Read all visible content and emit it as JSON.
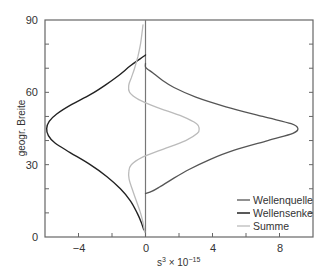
{
  "chart_data": {
    "type": "line",
    "title": "",
    "xlabel": "s³ × 10⁻¹⁵",
    "ylabel": "geogr. Breite",
    "xlim": [
      -6,
      10
    ],
    "ylim": [
      0,
      90
    ],
    "xticks": [
      -4,
      0,
      4,
      8
    ],
    "xticks_minor": [
      -6,
      -2,
      2,
      6,
      10
    ],
    "yticks": [
      0,
      30,
      60,
      90
    ],
    "yticks_minor": [
      10,
      20,
      40,
      50,
      70,
      80
    ],
    "grid": false,
    "zero_line": true,
    "legend_position": "lower right",
    "orientation": "x is value, y is latitude",
    "series": [
      {
        "name": "Wellenquelle",
        "color": "#555555",
        "width": 1.3,
        "lat": [
          18,
          19,
          21,
          24,
          28,
          32,
          36,
          40,
          43,
          45,
          47,
          50,
          54,
          58,
          62,
          65,
          68,
          69.5,
          70.5,
          72
        ],
        "values": [
          0,
          0.4,
          0.9,
          1.6,
          2.6,
          3.8,
          5.3,
          7.3,
          8.8,
          9.1,
          8.7,
          7.0,
          4.8,
          3.0,
          1.7,
          1.0,
          0.45,
          0.15,
          0,
          0
        ]
      },
      {
        "name": "Wellensenke",
        "color": "#222222",
        "width": 1.4,
        "lat": [
          3,
          6,
          10,
          15,
          20,
          25,
          30,
          35,
          39,
          42,
          45,
          48,
          51,
          55,
          59,
          63,
          67,
          71,
          74,
          75.5
        ],
        "values": [
          -0.1,
          -0.25,
          -0.5,
          -0.9,
          -1.5,
          -2.3,
          -3.3,
          -4.5,
          -5.4,
          -5.8,
          -5.9,
          -5.75,
          -5.3,
          -4.4,
          -3.3,
          -2.4,
          -1.6,
          -0.9,
          -0.3,
          0
        ]
      },
      {
        "name": "Summe",
        "color": "#bbbbbb",
        "width": 1.3,
        "lat": [
          2,
          6,
          10,
          15,
          20,
          24,
          27,
          30,
          33,
          36,
          40,
          43,
          45,
          47,
          50,
          54,
          57,
          60,
          63,
          66,
          70,
          75,
          80,
          85,
          88
        ],
        "values": [
          -0.05,
          -0.15,
          -0.3,
          -0.55,
          -0.8,
          -0.98,
          -1.0,
          -0.85,
          -0.2,
          0.9,
          2.4,
          3.1,
          3.2,
          3.05,
          2.2,
          0.6,
          -0.4,
          -0.95,
          -1.0,
          -0.85,
          -0.65,
          -0.45,
          -0.3,
          -0.2,
          -0.15
        ]
      }
    ]
  },
  "axes": {
    "y_title": "geogr. Breite",
    "x_title_base": "s",
    "x_title_sup": "3",
    "x_title_mid": " × 10",
    "x_title_exp": "−15",
    "x_tick_labels": [
      "−4",
      "0",
      "4",
      "8"
    ],
    "y_tick_labels": [
      "0",
      "30",
      "60",
      "90"
    ]
  },
  "legend": {
    "items": [
      {
        "label": "Wellenquelle",
        "color": "#555555"
      },
      {
        "label": "Wellensenke",
        "color": "#222222"
      },
      {
        "label": "Summe",
        "color": "#bbbbbb"
      }
    ]
  }
}
